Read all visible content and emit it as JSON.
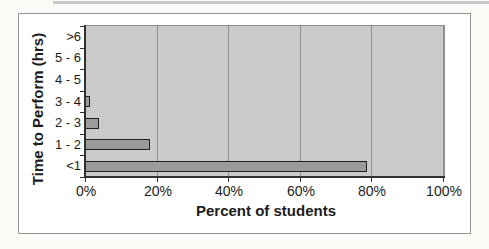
{
  "chart_data": {
    "type": "bar",
    "orientation": "horizontal",
    "title": "",
    "xlabel": "Percent of students",
    "ylabel": "Time to Perform (hrs)",
    "categories": [
      ">6",
      "5 - 6",
      "4 - 5",
      "3 - 4",
      "2 - 3",
      "1 - 2",
      "<1"
    ],
    "values": [
      0,
      0,
      0,
      1,
      3.5,
      18,
      78.5
    ],
    "x_tick_labels": [
      "0%",
      "20%",
      "40%",
      "60%",
      "80%",
      "100%"
    ],
    "x_tick_values": [
      0,
      20,
      40,
      60,
      80,
      100
    ],
    "xlim": [
      0,
      100
    ],
    "grid": true,
    "legend": false,
    "colors": {
      "bar_fill": "#9b9b9b",
      "bar_border": "#1f1f1f",
      "plot_background": "#cacaca",
      "gridline": "#8e8e8e",
      "axis": "#303030",
      "text": "#1c1c1c"
    }
  }
}
